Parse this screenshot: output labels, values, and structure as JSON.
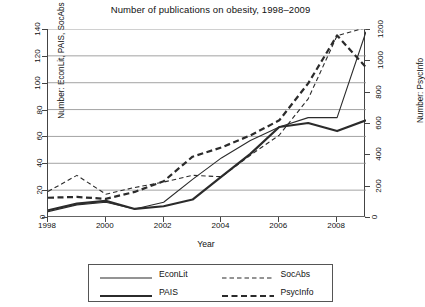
{
  "chart_data": {
    "type": "line",
    "title": "Number of publications on obesity, 1998–2009",
    "xlabel": "Year",
    "ylabel": "Number: EconLit, PAIS, SocAbs",
    "y2label": "Number: PsycInfo",
    "x": [
      1998,
      1999,
      2000,
      2001,
      2002,
      2003,
      2004,
      2005,
      2006,
      2007,
      2008,
      2009
    ],
    "xlim": [
      1998,
      2009
    ],
    "xticks": [
      1998,
      2000,
      2002,
      2004,
      2006,
      2008
    ],
    "ylim": [
      0,
      140
    ],
    "yticks": [
      0,
      20,
      40,
      60,
      80,
      100,
      120,
      140
    ],
    "y2lim": [
      0,
      1200
    ],
    "y2ticks": [
      0,
      200,
      400,
      600,
      800,
      1000,
      1200
    ],
    "grid": true,
    "legend_position": "below",
    "series": [
      {
        "name": "EconLit",
        "axis": "left",
        "style": "solid",
        "width": "thin",
        "values": [
          4,
          9,
          11,
          6,
          11,
          28,
          44,
          57,
          67,
          74,
          74,
          138
        ]
      },
      {
        "name": "PAIS",
        "axis": "left",
        "style": "solid",
        "width": "thick",
        "values": [
          5,
          10,
          12,
          6,
          8,
          13,
          30,
          47,
          67,
          70,
          64,
          72
        ]
      },
      {
        "name": "SocAbs",
        "axis": "left",
        "style": "dashed",
        "width": "thin",
        "values": [
          19,
          31,
          17,
          22,
          26,
          31,
          30,
          46,
          61,
          88,
          135,
          141
        ]
      },
      {
        "name": "PsycInfo",
        "axis": "right",
        "style": "dashed",
        "width": "thick",
        "values": [
          123,
          128,
          116,
          160,
          228,
          385,
          444,
          521,
          617,
          853,
          1159,
          955
        ]
      }
    ]
  },
  "legend": {
    "items": [
      {
        "label": "EconLit",
        "style": "solid",
        "width": "thin"
      },
      {
        "label": "SocAbs",
        "style": "dashed",
        "width": "thin"
      },
      {
        "label": "PAIS",
        "style": "solid",
        "width": "thick"
      },
      {
        "label": "PsycInfo",
        "style": "dashed",
        "width": "thick"
      }
    ]
  },
  "colors": {
    "line": "#2b2b2b",
    "grid": "#8c8c8c",
    "axis": "#444444",
    "text": "#111111",
    "background": "#ffffff"
  }
}
